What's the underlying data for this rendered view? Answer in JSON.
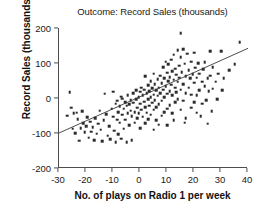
{
  "chart_data": {
    "type": "scatter",
    "title": "Outcome: Record Sales (thousands)",
    "xlabel": "No. of plays on Radio 1 per week",
    "ylabel": "Record Sales (thousands)",
    "xlim": [
      -30,
      40
    ],
    "ylim": [
      -200,
      200
    ],
    "xticks": [
      -30,
      -20,
      -10,
      0,
      10,
      20,
      30,
      40
    ],
    "yticks": [
      -200,
      -100,
      0,
      100,
      200
    ],
    "xtick_labels": [
      "-30",
      "-20",
      "-10",
      "0",
      "10",
      "20",
      "30",
      "40"
    ],
    "ytick_labels": [
      "-200",
      "-100",
      "0",
      "100",
      "200"
    ],
    "grid": false,
    "legend": false,
    "marker": "square",
    "marker_color": "#2b2b2b",
    "marker_size": 2.6,
    "trendline": {
      "type": "linear",
      "color": "#3a3a3a",
      "x_start": -30,
      "y_start": -100,
      "x_end": 40,
      "y_end": 142,
      "slope": 3.46,
      "intercept": 3.8
    },
    "n_points": 200,
    "points": [
      [
        -26.0,
        17.0
      ],
      [
        -25.5,
        -28.0
      ],
      [
        -25.0,
        -88.0
      ],
      [
        -24.5,
        -44.0
      ],
      [
        -23.5,
        -42.0
      ],
      [
        -23.0,
        -60.0
      ],
      [
        -22.5,
        -122.0
      ],
      [
        -22.0,
        -86.0
      ],
      [
        -21.0,
        -72.0
      ],
      [
        -20.5,
        -98.0
      ],
      [
        -20.0,
        -80.0
      ],
      [
        -19.5,
        -55.0
      ],
      [
        -19.0,
        -113.0
      ],
      [
        -18.5,
        -68.0
      ],
      [
        -18.0,
        -96.0
      ],
      [
        -17.5,
        -84.0
      ],
      [
        -17.0,
        -120.0
      ],
      [
        -16.5,
        -58.0
      ],
      [
        -16.0,
        -102.0
      ],
      [
        -15.5,
        -74.0
      ],
      [
        -15.0,
        -36.0
      ],
      [
        -14.5,
        -90.0
      ],
      [
        -14.0,
        -123.0
      ],
      [
        -13.5,
        -64.0
      ],
      [
        -13.0,
        12.0
      ],
      [
        -12.5,
        -46.0
      ],
      [
        -12.0,
        -108.0
      ],
      [
        -11.5,
        -80.0
      ],
      [
        -11.0,
        -118.0
      ],
      [
        -10.5,
        -30.0
      ],
      [
        -10.0,
        18.0
      ],
      [
        -10.0,
        -54.0
      ],
      [
        -9.5,
        -94.0
      ],
      [
        -9.0,
        -16.0
      ],
      [
        -9.0,
        -126.0
      ],
      [
        -8.5,
        -62.0
      ],
      [
        -8.5,
        -8.0
      ],
      [
        -8.0,
        -40.0
      ],
      [
        -8.0,
        -104.0
      ],
      [
        -7.5,
        -24.0
      ],
      [
        -7.5,
        -70.0
      ],
      [
        -7.0,
        4.0
      ],
      [
        -7.0,
        -116.0
      ],
      [
        -6.5,
        -48.0
      ],
      [
        -6.5,
        -2.0
      ],
      [
        -6.0,
        -88.0
      ],
      [
        -6.0,
        -30.0
      ],
      [
        -5.5,
        -12.0
      ],
      [
        -5.5,
        -62.0
      ],
      [
        -5.0,
        -126.0
      ],
      [
        -5.0,
        -22.0
      ],
      [
        -4.5,
        -44.0
      ],
      [
        -4.5,
        8.0
      ],
      [
        -4.0,
        -78.0
      ],
      [
        -4.0,
        -18.0
      ],
      [
        -3.5,
        -36.0
      ],
      [
        -3.5,
        -6.0
      ],
      [
        -3.0,
        -120.0
      ],
      [
        -3.0,
        -52.0
      ],
      [
        -2.5,
        -14.0
      ],
      [
        -2.5,
        14.0
      ],
      [
        -2.0,
        -40.0
      ],
      [
        -2.0,
        -70.0
      ],
      [
        -1.5,
        -4.0
      ],
      [
        -1.5,
        22.0
      ],
      [
        -1.0,
        -28.0
      ],
      [
        -1.0,
        -58.0
      ],
      [
        -0.5,
        2.0
      ],
      [
        -0.5,
        -44.0
      ],
      [
        0.0,
        18.0
      ],
      [
        0.0,
        -16.0
      ],
      [
        0.0,
        -86.0
      ],
      [
        0.5,
        30.0
      ],
      [
        0.5,
        -34.0
      ],
      [
        1.0,
        8.0
      ],
      [
        1.0,
        -54.0
      ],
      [
        1.5,
        24.0
      ],
      [
        1.5,
        -10.0
      ],
      [
        2.0,
        62.0
      ],
      [
        2.0,
        -26.0
      ],
      [
        2.0,
        -72.0
      ],
      [
        2.5,
        14.0
      ],
      [
        2.5,
        -42.0
      ],
      [
        3.0,
        36.0
      ],
      [
        3.0,
        -4.0
      ],
      [
        3.0,
        -60.0
      ],
      [
        3.5,
        20.0
      ],
      [
        3.5,
        -22.0
      ],
      [
        4.0,
        48.0
      ],
      [
        4.0,
        2.0
      ],
      [
        4.0,
        -48.0
      ],
      [
        4.5,
        28.0
      ],
      [
        4.5,
        -14.0
      ],
      [
        5.0,
        70.0
      ],
      [
        5.0,
        10.0
      ],
      [
        5.0,
        -34.0
      ],
      [
        5.0,
        -90.0
      ],
      [
        5.5,
        40.0
      ],
      [
        5.5,
        -6.0
      ],
      [
        6.0,
        22.0
      ],
      [
        6.0,
        -26.0
      ],
      [
        6.0,
        -64.0
      ],
      [
        6.5,
        54.0
      ],
      [
        6.5,
        6.0
      ],
      [
        7.0,
        30.0
      ],
      [
        7.0,
        -18.0
      ],
      [
        7.0,
        -76.0
      ],
      [
        7.5,
        64.0
      ],
      [
        7.5,
        14.0
      ],
      [
        8.0,
        42.0
      ],
      [
        8.0,
        -8.0
      ],
      [
        8.0,
        -50.0
      ],
      [
        8.5,
        88.0
      ],
      [
        8.5,
        24.0
      ],
      [
        9.0,
        56.0
      ],
      [
        9.0,
        2.0
      ],
      [
        9.0,
        -40.0
      ],
      [
        9.5,
        104.0
      ],
      [
        9.5,
        34.0
      ],
      [
        10.0,
        72.0
      ],
      [
        10.0,
        12.0
      ],
      [
        10.0,
        -30.0
      ],
      [
        10.0,
        -78.0
      ],
      [
        10.5,
        48.0
      ],
      [
        10.5,
        96.0
      ],
      [
        11.0,
        60.0
      ],
      [
        11.0,
        20.0
      ],
      [
        11.0,
        -20.0
      ],
      [
        11.5,
        110.0
      ],
      [
        11.5,
        38.0
      ],
      [
        12.0,
        76.0
      ],
      [
        12.0,
        8.0
      ],
      [
        12.0,
        -44.0
      ],
      [
        12.5,
        52.0
      ],
      [
        12.5,
        124.0
      ],
      [
        13.0,
        84.0
      ],
      [
        13.0,
        30.0
      ],
      [
        13.0,
        -12.0
      ],
      [
        13.5,
        66.0
      ],
      [
        13.5,
        16.0
      ],
      [
        14.0,
        136.0
      ],
      [
        14.0,
        46.0
      ],
      [
        14.0,
        -4.0
      ],
      [
        14.5,
        92.0
      ],
      [
        14.5,
        58.0
      ],
      [
        15.0,
        185.0
      ],
      [
        15.0,
        116.0
      ],
      [
        15.0,
        24.0
      ],
      [
        15.0,
        -34.0
      ],
      [
        15.5,
        74.0
      ],
      [
        16.0,
        140.0
      ],
      [
        16.0,
        40.0
      ],
      [
        16.0,
        -8.0
      ],
      [
        16.5,
        98.0
      ],
      [
        17.0,
        62.0
      ],
      [
        17.0,
        14.0
      ],
      [
        17.0,
        -58.0
      ],
      [
        17.5,
        126.0
      ],
      [
        18.0,
        80.0
      ],
      [
        18.0,
        30.0
      ],
      [
        18.5,
        56.0
      ],
      [
        19.0,
        104.0
      ],
      [
        19.0,
        10.0
      ],
      [
        19.0,
        -28.0
      ],
      [
        19.5,
        68.0
      ],
      [
        20.0,
        130.0
      ],
      [
        20.0,
        44.0
      ],
      [
        20.0,
        -12.0
      ],
      [
        20.5,
        86.0
      ],
      [
        21.0,
        58.0
      ],
      [
        21.0,
        8.0
      ],
      [
        21.5,
        100.0
      ],
      [
        22.0,
        70.0
      ],
      [
        22.0,
        22.0
      ],
      [
        22.5,
        -52.0
      ],
      [
        23.0,
        46.0
      ],
      [
        23.0,
        -16.0
      ],
      [
        23.5,
        82.0
      ],
      [
        24.0,
        34.0
      ],
      [
        24.0,
        102.0
      ],
      [
        24.5,
        -6.0
      ],
      [
        25.0,
        56.0
      ],
      [
        25.0,
        -74.0
      ],
      [
        25.5,
        20.0
      ],
      [
        26.0,
        134.0
      ],
      [
        26.0,
        64.0
      ],
      [
        26.5,
        -38.0
      ],
      [
        27.0,
        88.0
      ],
      [
        27.0,
        26.0
      ],
      [
        28.0,
        46.0
      ],
      [
        28.5,
        -4.0
      ],
      [
        29.0,
        70.0
      ],
      [
        30.0,
        134.0
      ],
      [
        30.5,
        22.0
      ],
      [
        31.0,
        56.0
      ],
      [
        33.0,
        80.0
      ],
      [
        35.0,
        96.0
      ],
      [
        37.0,
        160.0
      ],
      [
        -27.0,
        -50.0
      ],
      [
        -24.0,
        -100.0
      ],
      [
        -21.5,
        -38.0
      ],
      [
        12.5,
        -64.0
      ],
      [
        16.5,
        -70.0
      ],
      [
        21.0,
        -42.0
      ]
    ]
  }
}
